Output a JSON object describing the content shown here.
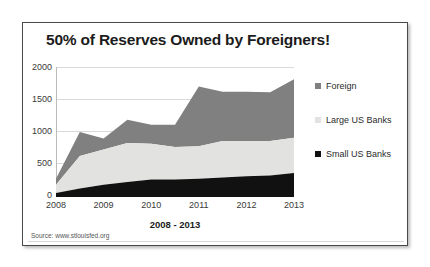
{
  "chart_title": "50% of Reserves Owned by Foreigners!",
  "source_text": "Source: www.stlouisfed.org",
  "axes": {
    "xlabel": "2008 - 2013",
    "ylabel": "",
    "yticks": [
      "2000",
      "1500",
      "1000",
      "500",
      "0"
    ],
    "xticks": [
      "2008",
      "2009",
      "2010",
      "2011",
      "2012",
      "2013"
    ]
  },
  "legend": {
    "items": [
      {
        "label": "Foreign",
        "color": "#808080"
      },
      {
        "label": "Large US Banks",
        "color": "#e2e2e0"
      },
      {
        "label": "Small US Banks",
        "color": "#111111"
      }
    ]
  },
  "colors": {
    "foreign": "#808080",
    "large_us_banks": "#e2e2e0",
    "small_us_banks": "#111111",
    "gridline": "#d9d9d9",
    "axis": "#bbbbbb",
    "frame": "#4a4a4a",
    "text": "#1c1c1c"
  },
  "chart_data": {
    "type": "area",
    "stacked": true,
    "title": "50% of Reserves Owned by Foreigners!",
    "xlabel": "2008 - 2013",
    "ylabel": "",
    "ylim": [
      0,
      2000
    ],
    "ygrid": true,
    "legend_position": "right",
    "x": [
      2008,
      2008.5,
      2009,
      2009.5,
      2010,
      2010.5,
      2011,
      2011.5,
      2012,
      2012.5,
      2013
    ],
    "xtick_labels": [
      "2008",
      "2009",
      "2010",
      "2011",
      "2012",
      "2013"
    ],
    "xtick_values": [
      2008,
      2009,
      2010,
      2011,
      2012,
      2013
    ],
    "series": [
      {
        "name": "Small US Banks",
        "color": "#111111",
        "values": [
          60,
          130,
          190,
          230,
          270,
          270,
          280,
          300,
          320,
          330,
          370
        ]
      },
      {
        "name": "Large US Banks",
        "color": "#e2e2e0",
        "values": [
          130,
          500,
          540,
          600,
          550,
          500,
          500,
          560,
          540,
          530,
          540
        ]
      },
      {
        "name": "Foreign",
        "color": "#808080",
        "values": [
          90,
          370,
          170,
          360,
          290,
          340,
          920,
          760,
          760,
          750,
          900
        ]
      }
    ],
    "stack_totals": [
      280,
      1000,
      900,
      1190,
      1110,
      1110,
      1700,
      1620,
      1620,
      1610,
      1810
    ]
  }
}
